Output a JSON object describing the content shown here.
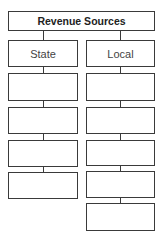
{
  "diagram": {
    "title": "Revenue Sources",
    "columns": [
      {
        "label": "State",
        "blank_boxes": 4
      },
      {
        "label": "Local",
        "blank_boxes": 5
      }
    ]
  },
  "colors": {
    "border": "#3a3a3a",
    "background": "#ffffff",
    "text": "#333333"
  }
}
